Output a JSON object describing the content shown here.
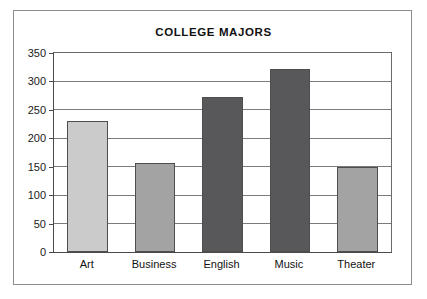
{
  "chart_data": {
    "type": "bar",
    "title": "COLLEGE MAJORS",
    "categories": [
      "Art",
      "Business",
      "English",
      "Music",
      "Theater"
    ],
    "values": [
      230,
      157,
      273,
      322,
      150
    ],
    "bar_colors": [
      "#cbcbcb",
      "#a3a3a3",
      "#58585a",
      "#58585a",
      "#a3a3a3"
    ],
    "bar_border_color": "#4e4e4e",
    "xlabel": "",
    "ylabel": "",
    "ylim": [
      0,
      350
    ],
    "yticks": [
      0,
      50,
      100,
      150,
      200,
      250,
      300,
      350
    ],
    "ytick_labels": [
      "0",
      "50",
      "100",
      "150",
      "200",
      "250",
      "300",
      "350"
    ],
    "grid": true,
    "grid_axis": "y",
    "grid_color": "#7b7b7b",
    "legend": false,
    "legend_position": "none",
    "axis_color": "#4a4a4a",
    "background_color": "#ffffff",
    "frame_color": "#8d8d8d"
  }
}
